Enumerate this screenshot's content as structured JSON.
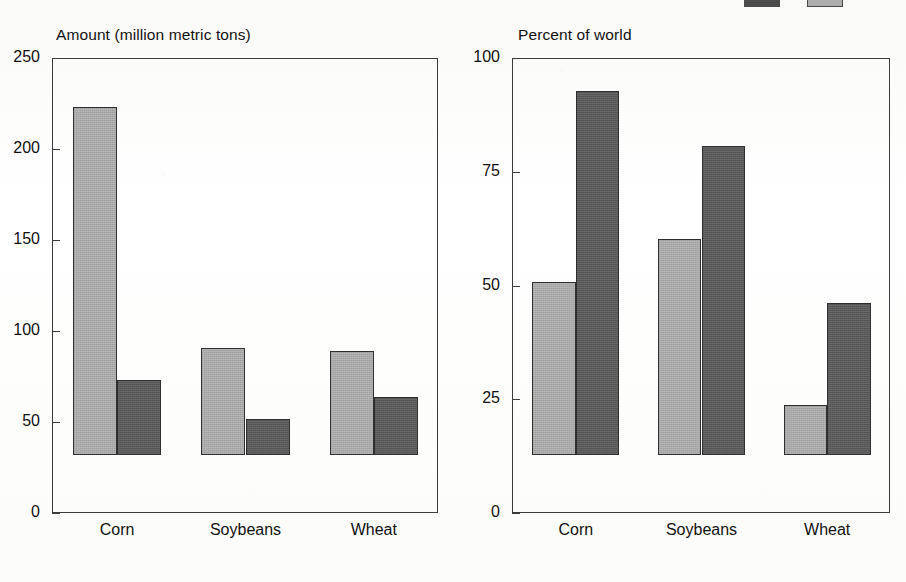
{
  "figure": {
    "legend": {
      "clipped": true,
      "items": [
        {
          "label": "",
          "swatch": "dark-swatch",
          "color": "#4c4c4c"
        },
        {
          "label": "",
          "swatch": "light-swatch",
          "color": "#adadad"
        }
      ]
    }
  },
  "chart_data": [
    {
      "type": "bar",
      "title": "Amount (million metric tons)",
      "panel": "left",
      "xlabel": "",
      "ylabel": "Amount (million metric tons)",
      "ylim": [
        0,
        250
      ],
      "yticks": [
        0,
        50,
        100,
        150,
        200,
        250
      ],
      "ytick_labels": [
        "0",
        "50",
        "100",
        "150",
        "200",
        "250"
      ],
      "grid": false,
      "legend_position": "top-right (clipped)",
      "categories": [
        "Corn",
        "Soybeans",
        "Wheat"
      ],
      "series": [
        {
          "name": "Production",
          "color": "#a9a9a9",
          "values": [
            191,
            59,
            57
          ]
        },
        {
          "name": "Exports",
          "color": "#585858",
          "values": [
            41,
            20,
            32
          ]
        }
      ]
    },
    {
      "type": "bar",
      "title": "Percent of world",
      "panel": "right",
      "xlabel": "",
      "ylabel": "Percent of world",
      "ylim": [
        0,
        100
      ],
      "yticks": [
        0,
        25,
        50,
        75,
        100
      ],
      "ytick_labels": [
        "0",
        "25",
        "50",
        "75",
        "100"
      ],
      "grid": false,
      "legend_position": "top-right (clipped)",
      "categories": [
        "Corn",
        "Soybeans",
        "Wheat"
      ],
      "series": [
        {
          "name": "Production",
          "color": "#a9a9a9",
          "values": [
            38,
            47.5,
            11
          ]
        },
        {
          "name": "Exports",
          "color": "#585858",
          "values": [
            80,
            68,
            33.5
          ]
        }
      ]
    }
  ]
}
